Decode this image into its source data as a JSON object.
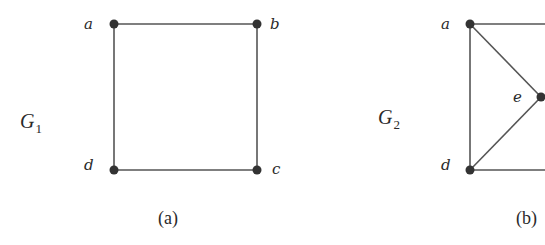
{
  "figure": {
    "panels": [
      {
        "caption": "(a)",
        "graph_name": "G",
        "graph_subscript": "1",
        "vertices": [
          {
            "id": "a",
            "label": "a"
          },
          {
            "id": "b",
            "label": "b"
          },
          {
            "id": "c",
            "label": "c"
          },
          {
            "id": "d",
            "label": "d"
          }
        ],
        "edges": [
          [
            "a",
            "b"
          ],
          [
            "b",
            "c"
          ],
          [
            "c",
            "d"
          ],
          [
            "d",
            "a"
          ]
        ]
      },
      {
        "caption": "(b)",
        "graph_name": "G",
        "graph_subscript": "2",
        "vertices": [
          {
            "id": "a",
            "label": "a"
          },
          {
            "id": "d",
            "label": "d"
          },
          {
            "id": "e",
            "label": "e"
          }
        ],
        "edges": [
          [
            "a",
            "d"
          ],
          [
            "a",
            "e"
          ],
          [
            "d",
            "e"
          ],
          [
            "a",
            "(cropped right)"
          ],
          [
            "d",
            "(cropped right)"
          ]
        ]
      }
    ],
    "colors": {
      "edge": "#555555",
      "node": "#333333",
      "text": "#2a2a2a"
    }
  }
}
